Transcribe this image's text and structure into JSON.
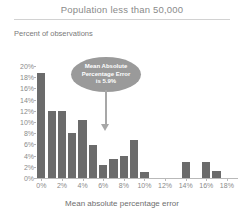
{
  "header": {
    "title": "Population less than 50,000"
  },
  "axis": {
    "y_caption": "Percent of observations",
    "x_caption": "Mean absolute percentage error"
  },
  "annotation": {
    "line1": "Mean Absolute",
    "line2": "Percentage Error",
    "line3": "is 5.9%",
    "points_to": "6%"
  },
  "colors": {
    "bar": "#6b6b6b",
    "callout": "#9a9a9a",
    "callout_text": "#ffffff",
    "axis": "#b9b9b9",
    "title_text": "#8a8a8a",
    "background": "#ffffff"
  },
  "chart_data": {
    "type": "bar",
    "title": "Population less than 50,000",
    "xlabel": "Mean absolute percentage error",
    "ylabel": "Percent of observations",
    "ylim": [
      0,
      20
    ],
    "ytick_labels": [
      "0%",
      "2%",
      "4%",
      "6%",
      "8%",
      "10%",
      "12%",
      "14%",
      "16%",
      "18%",
      "20%"
    ],
    "ytick_values": [
      0,
      2,
      4,
      6,
      8,
      10,
      12,
      14,
      16,
      18,
      20
    ],
    "xtick_labels": [
      "0%",
      "2%",
      "4%",
      "6%",
      "8%",
      "10%",
      "12%",
      "14%",
      "16%",
      "18%"
    ],
    "xtick_values": [
      0,
      2,
      4,
      6,
      8,
      10,
      12,
      14,
      16,
      18
    ],
    "xlim": [
      -0.5,
      19
    ],
    "grid": false,
    "legend": false,
    "categories": [
      "0%",
      "1%",
      "2%",
      "3%",
      "4%",
      "5%",
      "6%",
      "7%",
      "8%",
      "9%",
      "10%",
      "11%",
      "12%",
      "13%",
      "14%",
      "15%",
      "16%",
      "17%",
      "18%"
    ],
    "x": [
      0,
      1,
      2,
      3,
      4,
      5,
      6,
      7,
      8,
      9,
      10,
      11,
      12,
      13,
      14,
      15,
      16,
      17,
      18
    ],
    "values": [
      18.7,
      12.0,
      12.0,
      8.0,
      10.4,
      5.9,
      2.4,
      3.4,
      3.9,
      6.8,
      1.1,
      0,
      0,
      0,
      2.9,
      0,
      2.9,
      1.3,
      0
    ]
  }
}
